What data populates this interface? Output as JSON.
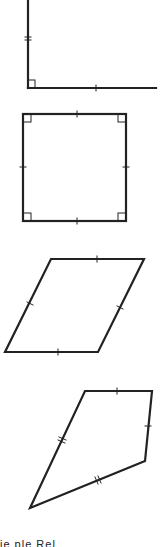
{
  "figure": {
    "shapes": [
      {
        "name": "right-angle",
        "label": "Right angle with marked sides"
      },
      {
        "name": "square",
        "label": "Square with four equal sides and four right angles"
      },
      {
        "name": "rhombus",
        "label": "Rhombus with four equal sides"
      },
      {
        "name": "kite",
        "label": "Kite with two pairs of equal adjacent sides"
      }
    ],
    "caption": "ie    ple    Rel"
  },
  "colors": {
    "stroke": "#222222",
    "background": "#ffffff"
  }
}
